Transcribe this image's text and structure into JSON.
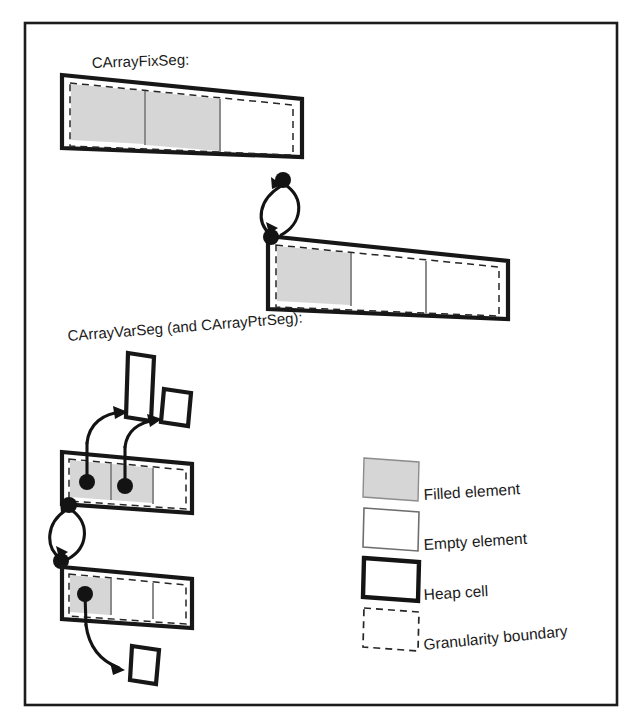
{
  "figure": {
    "background_color": "#ffffff",
    "frame_color": "#1c1c1c",
    "labels": {
      "fix_seg": "CArrayFixSeg:",
      "var_seg": "CArrayVarSeg (and CArrayPtrSeg):"
    }
  },
  "colors": {
    "filled_element": "#d6d6d6",
    "empty_element": "#ffffff",
    "heap_cell_stroke": "#171717",
    "granularity_stroke": "#262626",
    "pointer_dot": "#131313"
  },
  "legend": {
    "items": [
      {
        "label": "Filled element",
        "swatch": "filled-swatch"
      },
      {
        "label": "Empty element",
        "swatch": "empty-swatch"
      },
      {
        "label": "Heap cell",
        "swatch": "heap-cell-swatch"
      },
      {
        "label": "Granularity boundary",
        "swatch": "granularity-swatch"
      }
    ]
  },
  "diagram_data": {
    "type": "diagram",
    "title": "Segmented array memory layouts",
    "sections": [
      {
        "name": "CArrayFixSeg",
        "label": "CArrayFixSeg:",
        "segments": [
          {
            "id": "fix-seg-1",
            "cells": 3,
            "filled": 2,
            "empty": 1
          },
          {
            "id": "fix-seg-2",
            "cells": 3,
            "filled": 1,
            "empty": 2
          }
        ],
        "links": [
          {
            "from": "fix-seg-1",
            "to": "fix-seg-2",
            "style": "bidirectional-curve"
          }
        ]
      },
      {
        "name": "CArrayVarSeg",
        "label": "CArrayVarSeg (and CArrayPtrSeg):",
        "segments": [
          {
            "id": "var-seg-1",
            "cells": 3,
            "filled": 2,
            "empty": 1,
            "pointers": 2
          },
          {
            "id": "var-seg-2",
            "cells": 3,
            "filled": 1,
            "empty": 2,
            "pointers": 1
          }
        ],
        "external_cells": [
          {
            "id": "var-cell-tall",
            "shape": "tall-heap-cell"
          },
          {
            "id": "var-cell-small",
            "shape": "small-heap-cell"
          },
          {
            "id": "var-cell-bottom",
            "shape": "small-heap-cell"
          }
        ],
        "links": [
          {
            "from": "var-seg-1",
            "to": "var-seg-2",
            "style": "bidirectional-curve"
          },
          {
            "from": "var-seg-1.pointer-1",
            "to": "var-cell-tall",
            "style": "arrow"
          },
          {
            "from": "var-seg-1.pointer-2",
            "to": "var-cell-small",
            "style": "arrow"
          },
          {
            "from": "var-seg-2.pointer-1",
            "to": "var-cell-bottom",
            "style": "arrow"
          }
        ]
      }
    ]
  }
}
